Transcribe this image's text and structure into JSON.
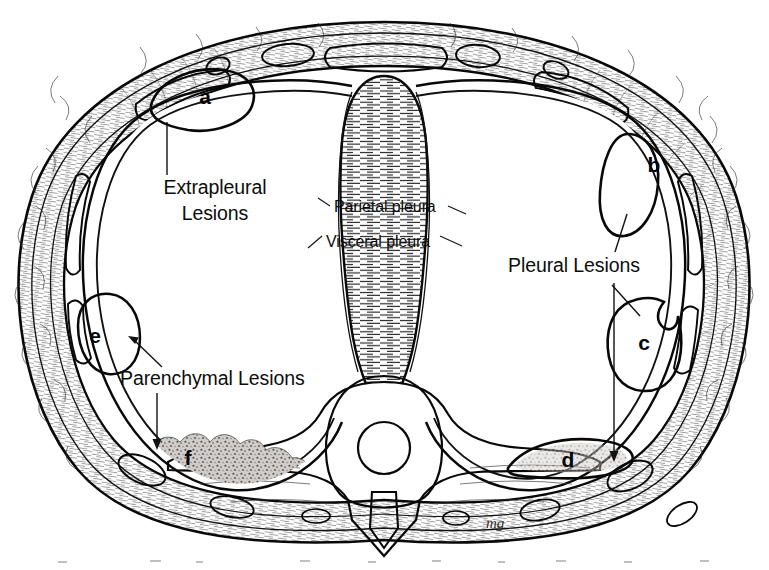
{
  "figure": {
    "signature": "mg",
    "background_color": "#ffffff",
    "ink_color": "#111111"
  },
  "callouts": [
    {
      "id": "extrapleural",
      "line1": "Extrapleural",
      "line2": "Lesions",
      "targets": [
        "a"
      ]
    },
    {
      "id": "pleural",
      "line1": "Pleural Lesions",
      "line2": "",
      "targets": [
        "b",
        "c",
        "d"
      ]
    },
    {
      "id": "parenchymal",
      "line1": "Parenchymal Lesions",
      "line2": "",
      "targets": [
        "e",
        "f"
      ]
    }
  ],
  "structure_labels": [
    {
      "id": "parietal",
      "text": "Parietal pleura"
    },
    {
      "id": "visceral",
      "text": "Visceral pleura"
    }
  ],
  "lesions": [
    {
      "key": "a",
      "letter": "a",
      "category": "Extrapleural",
      "texture": "stipple",
      "fill": "#b5b0ac"
    },
    {
      "key": "b",
      "letter": "b",
      "category": "Pleural",
      "texture": "stipple",
      "fill": "#b3aeaa"
    },
    {
      "key": "c",
      "letter": "c",
      "category": "Pleural",
      "texture": "stipple",
      "fill": "#b4afab"
    },
    {
      "key": "d",
      "letter": "d",
      "category": "Pleural",
      "texture": "smooth",
      "fill": "#bdbab7"
    },
    {
      "key": "e",
      "letter": "e",
      "category": "Parenchymal",
      "texture": "stipple",
      "fill": "#b2adaa"
    },
    {
      "key": "f",
      "letter": "f",
      "category": "Parenchymal",
      "texture": "diffuse-stipple",
      "fill": "#bcb8b5"
    }
  ]
}
